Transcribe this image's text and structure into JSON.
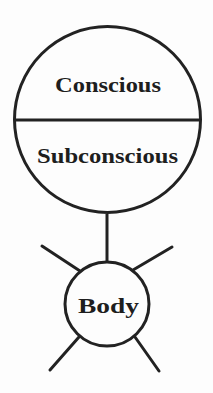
{
  "diagram": {
    "type": "mind-body model",
    "colors": {
      "stroke": "#222222",
      "text": "#1e1e1e",
      "background": "#fdfdfd"
    },
    "mind_circle": {
      "top_label": "Conscious",
      "bottom_label": "Subconscious"
    },
    "body_circle": {
      "label": "Body"
    }
  }
}
